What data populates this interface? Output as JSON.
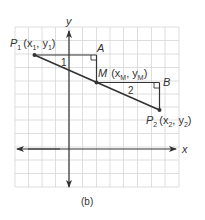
{
  "figure": {
    "caption": "(b)",
    "axes": {
      "x_label": "x",
      "y_label": "y"
    },
    "points": {
      "P1": {
        "name": "P",
        "sub": "1",
        "coord_text": "(x",
        "coord_sub1": "1",
        "coord_mid": ", y",
        "coord_sub2": "1",
        "coord_end": ")"
      },
      "M": {
        "name": "M",
        "coord_text": "(x",
        "coord_sub1": "M",
        "coord_mid": ", y",
        "coord_sub2": "M",
        "coord_end": ")"
      },
      "P2": {
        "name": "P",
        "sub": "2",
        "coord_text": "(x",
        "coord_sub1": "2",
        "coord_mid": ", y",
        "coord_sub2": "2",
        "coord_end": ")"
      },
      "A": {
        "name": "A"
      },
      "B": {
        "name": "B"
      }
    },
    "triangle_labels": {
      "t1": "1",
      "t2": "2"
    },
    "colors": {
      "grid": "#d6d6d6",
      "lines": "#333333",
      "text": "#333333"
    }
  }
}
